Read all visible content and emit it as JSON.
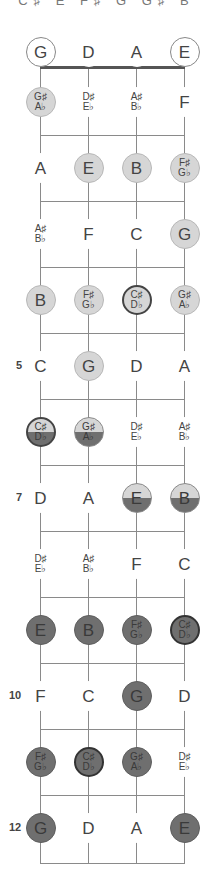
{
  "header": {
    "scale_notes": "C♯ E F♯ G G♯ B"
  },
  "strings": [
    {
      "name": "G",
      "x": 40
    },
    {
      "name": "D",
      "x": 88
    },
    {
      "name": "A",
      "x": 136
    },
    {
      "name": "E",
      "x": 184
    }
  ],
  "fret_markers": [
    {
      "fret": 5,
      "label": "5"
    },
    {
      "fret": 7,
      "label": "7"
    },
    {
      "fret": 10,
      "label": "10"
    },
    {
      "fret": 12,
      "label": "12"
    }
  ],
  "colors": {
    "light": "#d6d6d6",
    "dark": "#6f6f6f",
    "line": "#8a8a8a",
    "nut": "#555555"
  },
  "rows": [
    {
      "fret": 0,
      "notes": [
        {
          "t": "G",
          "style": "open"
        },
        {
          "t": "D",
          "style": "plain"
        },
        {
          "t": "A",
          "style": "plain"
        },
        {
          "t": "E",
          "style": "open"
        }
      ]
    },
    {
      "fret": 1,
      "notes": [
        {
          "t": "G♯",
          "b": "A♭",
          "style": "light"
        },
        {
          "t": "D♯",
          "b": "E♭",
          "style": "plain"
        },
        {
          "t": "A♯",
          "b": "B♭",
          "style": "plain"
        },
        {
          "t": "F",
          "style": "plain"
        }
      ]
    },
    {
      "fret": 2,
      "notes": [
        {
          "t": "A",
          "style": "plain"
        },
        {
          "t": "E",
          "style": "light"
        },
        {
          "t": "B",
          "style": "light"
        },
        {
          "t": "F♯",
          "b": "G♭",
          "style": "light"
        }
      ]
    },
    {
      "fret": 3,
      "notes": [
        {
          "t": "A♯",
          "b": "B♭",
          "style": "plain"
        },
        {
          "t": "F",
          "style": "plain"
        },
        {
          "t": "C",
          "style": "plain"
        },
        {
          "t": "G",
          "style": "light"
        }
      ]
    },
    {
      "fret": 4,
      "notes": [
        {
          "t": "B",
          "style": "light"
        },
        {
          "t": "F♯",
          "b": "G♭",
          "style": "light"
        },
        {
          "t": "C♯",
          "b": "D♭",
          "style": "light root"
        },
        {
          "t": "G♯",
          "b": "A♭",
          "style": "light"
        }
      ]
    },
    {
      "fret": 5,
      "notes": [
        {
          "t": "C",
          "style": "plain"
        },
        {
          "t": "G",
          "style": "light"
        },
        {
          "t": "D",
          "style": "plain"
        },
        {
          "t": "A",
          "style": "plain"
        }
      ]
    },
    {
      "fret": 6,
      "notes": [
        {
          "t": "C♯",
          "b": "D♭",
          "style": "half root"
        },
        {
          "t": "G♯",
          "b": "A♭",
          "style": "half"
        },
        {
          "t": "D♯",
          "b": "E♭",
          "style": "plain"
        },
        {
          "t": "A♯",
          "b": "B♭",
          "style": "plain"
        }
      ]
    },
    {
      "fret": 7,
      "notes": [
        {
          "t": "D",
          "style": "plain"
        },
        {
          "t": "A",
          "style": "plain"
        },
        {
          "t": "E",
          "style": "half"
        },
        {
          "t": "B",
          "style": "half"
        }
      ]
    },
    {
      "fret": 8,
      "notes": [
        {
          "t": "D♯",
          "b": "E♭",
          "style": "plain"
        },
        {
          "t": "A♯",
          "b": "B♭",
          "style": "plain"
        },
        {
          "t": "F",
          "style": "plain"
        },
        {
          "t": "C",
          "style": "plain"
        }
      ]
    },
    {
      "fret": 9,
      "notes": [
        {
          "t": "E",
          "style": "dark"
        },
        {
          "t": "B",
          "style": "dark"
        },
        {
          "t": "F♯",
          "b": "G♭",
          "style": "dark"
        },
        {
          "t": "C♯",
          "b": "D♭",
          "style": "dark root"
        }
      ]
    },
    {
      "fret": 10,
      "notes": [
        {
          "t": "F",
          "style": "plain"
        },
        {
          "t": "C",
          "style": "plain"
        },
        {
          "t": "G",
          "style": "dark"
        },
        {
          "t": "D",
          "style": "plain"
        }
      ]
    },
    {
      "fret": 11,
      "notes": [
        {
          "t": "F♯",
          "b": "G♭",
          "style": "dark"
        },
        {
          "t": "C♯",
          "b": "D♭",
          "style": "dark root"
        },
        {
          "t": "G♯",
          "b": "A♭",
          "style": "dark"
        },
        {
          "t": "D♯",
          "b": "E♭",
          "style": "plain"
        }
      ]
    },
    {
      "fret": 12,
      "notes": [
        {
          "t": "G",
          "style": "dark"
        },
        {
          "t": "D",
          "style": "plain"
        },
        {
          "t": "A",
          "style": "plain"
        },
        {
          "t": "E",
          "style": "dark"
        }
      ]
    }
  ]
}
